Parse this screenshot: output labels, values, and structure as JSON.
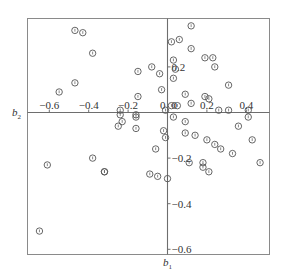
{
  "chart_data": {
    "type": "scatter",
    "title": "",
    "xlabel": "b1",
    "ylabel": "b2",
    "xlim": [
      -0.71,
      0.52
    ],
    "ylim": [
      -0.62,
      0.41
    ],
    "grid": false,
    "legend": null,
    "axes_through_origin": true,
    "x_ticks": [
      -0.6,
      -0.4,
      -0.2,
      0,
      0.2,
      0.4
    ],
    "y_ticks": [
      0.2,
      0,
      -0.2,
      -0.4,
      -0.6
    ],
    "x_tick_labels": [
      "-0.6",
      "-0.4",
      "-0.2",
      "0",
      "0.2",
      "0.4"
    ],
    "y_tick_labels": [
      "0.2",
      "0",
      "-0.2",
      "-0.4",
      "-0.6"
    ],
    "marker": "open-circle",
    "points": [
      [
        -0.47,
        0.36
      ],
      [
        -0.43,
        0.35
      ],
      [
        -0.38,
        0.26
      ],
      [
        -0.47,
        0.13
      ],
      [
        -0.55,
        0.09
      ],
      [
        -0.08,
        0.2
      ],
      [
        -0.15,
        0.18
      ],
      [
        -0.04,
        0.17
      ],
      [
        -0.03,
        0.1
      ],
      [
        -0.15,
        0.07
      ],
      [
        -0.24,
        0.01
      ],
      [
        -0.01,
        0.01
      ],
      [
        -0.16,
        -0.01
      ],
      [
        -0.24,
        -0.01
      ],
      [
        -0.25,
        -0.06
      ],
      [
        -0.23,
        -0.04
      ],
      [
        -0.16,
        -0.02
      ],
      [
        -0.16,
        -0.07
      ],
      [
        -0.02,
        -0.08
      ],
      [
        -0.01,
        -0.11
      ],
      [
        -0.06,
        -0.16
      ],
      [
        -0.32,
        -0.26
      ],
      [
        -0.09,
        -0.27
      ],
      [
        -0.05,
        -0.28
      ],
      [
        0.0,
        -0.29
      ],
      [
        -0.61,
        -0.23
      ],
      [
        -0.38,
        -0.2
      ],
      [
        -0.32,
        -0.26
      ],
      [
        -0.65,
        -0.52
      ],
      [
        0.12,
        0.38
      ],
      [
        0.02,
        0.31
      ],
      [
        0.06,
        0.32
      ],
      [
        0.12,
        0.28
      ],
      [
        0.03,
        0.23
      ],
      [
        0.04,
        0.19
      ],
      [
        0.03,
        0.15
      ],
      [
        0.19,
        0.24
      ],
      [
        0.23,
        0.24
      ],
      [
        0.24,
        0.2
      ],
      [
        0.31,
        0.12
      ],
      [
        0.09,
        0.08
      ],
      [
        0.19,
        0.07
      ],
      [
        0.21,
        0.06
      ],
      [
        0.12,
        0.04
      ],
      [
        0.02,
        0.03
      ],
      [
        0.05,
        0.03
      ],
      [
        0.26,
        0.01
      ],
      [
        0.31,
        0.01
      ],
      [
        0.41,
        0.01
      ],
      [
        0.03,
        -0.02
      ],
      [
        0.09,
        -0.04
      ],
      [
        0.09,
        -0.09
      ],
      [
        0.14,
        -0.1
      ],
      [
        0.2,
        -0.12
      ],
      [
        0.24,
        -0.14
      ],
      [
        0.27,
        -0.16
      ],
      [
        0.36,
        -0.06
      ],
      [
        0.41,
        -0.02
      ],
      [
        0.43,
        -0.12
      ],
      [
        0.11,
        -0.22
      ],
      [
        0.18,
        -0.22
      ],
      [
        0.33,
        -0.18
      ],
      [
        0.47,
        -0.22
      ],
      [
        0.18,
        -0.24
      ],
      [
        0.21,
        -0.26
      ]
    ]
  },
  "labels": {
    "x_axis": "b",
    "x_axis_sub": "1",
    "y_axis": "b",
    "y_axis_sub": "2",
    "x_ticks": [
      "−0.6",
      "−0.4",
      "−0.2",
      "0",
      "0.2",
      "0.4"
    ],
    "y_ticks": [
      "0.2",
      "0",
      "−0.2",
      "−0.4",
      "−0.6"
    ]
  }
}
